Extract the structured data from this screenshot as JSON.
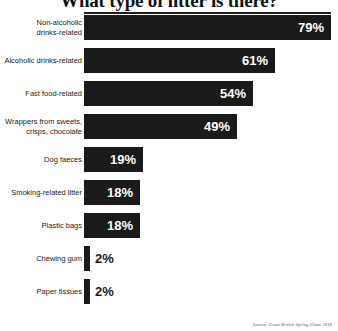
{
  "chart_data": {
    "type": "bar",
    "orientation": "horizontal",
    "title": "What type of litter is there?",
    "xlabel": "",
    "ylabel": "",
    "xlim": [
      0,
      79
    ],
    "grid": false,
    "legend": null,
    "value_suffix": "%",
    "source": "Source: Great British Spring Clean 2018",
    "categories": [
      "Non-alcoholic drinks-related",
      "Alcoholic drinks-related",
      "Fast food-related",
      "Wrappers from sweets, crisps, chocolate",
      "Dog faeces",
      "Smoking-related litter",
      "Plastic bags",
      "Chewing gum",
      "Paper tissues"
    ],
    "values": [
      79,
      61,
      54,
      49,
      19,
      18,
      18,
      2,
      2
    ],
    "value_labels": [
      "79%",
      "61%",
      "54%",
      "49%",
      "19%",
      "18%",
      "18%",
      "2%",
      "2%"
    ],
    "bars": [
      {
        "label_line1": "Non-alcoholic",
        "label_line2": "drinks-related",
        "value": 79,
        "value_label": "79%",
        "label_inside": true
      },
      {
        "label_line1": "Alcoholic drinks-related",
        "label_line2": "",
        "value": 61,
        "value_label": "61%",
        "label_inside": true
      },
      {
        "label_line1": "Fast food-related",
        "label_line2": "",
        "value": 54,
        "value_label": "54%",
        "label_inside": true
      },
      {
        "label_line1": "Wrappers from sweets,",
        "label_line2": "crisps, chocolate",
        "value": 49,
        "value_label": "49%",
        "label_inside": true
      },
      {
        "label_line1": "Dog faeces",
        "label_line2": "",
        "value": 19,
        "value_label": "19%",
        "label_inside": true
      },
      {
        "label_line1": "Smoking-related litter",
        "label_line2": "",
        "value": 18,
        "value_label": "18%",
        "label_inside": true
      },
      {
        "label_line1": "Plastic bags",
        "label_line2": "",
        "value": 18,
        "value_label": "18%",
        "label_inside": true
      },
      {
        "label_line1": "Chewing gum",
        "label_line2": "",
        "value": 2,
        "value_label": "2%",
        "label_inside": false
      },
      {
        "label_line1": "Paper tissues",
        "label_line2": "",
        "value": 2,
        "value_label": "2%",
        "label_inside": false
      }
    ],
    "colors": {
      "bar": "#1a1a1a",
      "background": "#ffffff",
      "value_inside_text": "#ffffff",
      "value_outside_text": "#1a1a1a",
      "category_text": "#1a1a1a",
      "title_text": "#111111",
      "rule": "#1c1c1c",
      "source_text": "#555555"
    }
  }
}
